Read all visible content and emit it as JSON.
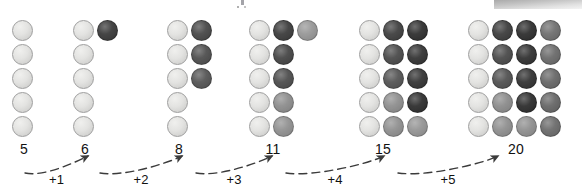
{
  "figure": {
    "type": "dot-array-sequence-diagram",
    "circle": {
      "diameter_px": 21,
      "row_pitch_px": 24,
      "col_pitch_px": 24,
      "rows_per_column": 5
    },
    "palette": {
      "light": "#e4e4e2",
      "outline": "#9e9e9e",
      "dark_1": "#3a3a3a",
      "dark_2": "#4a4a4a",
      "dark_3": "#565656",
      "mid_1": "#8a8a8a",
      "mid_2": "#949494",
      "mid_3": "#7e7e7e",
      "near_black": "#2b2b2b",
      "text": "#111111",
      "arrow": "#3b3b3b"
    },
    "groups": [
      {
        "total_label": "5",
        "total_value": 5,
        "x": 12,
        "label_x": -8,
        "columns": [
          {
            "count": 5,
            "shades": [
              "light",
              "light",
              "light",
              "light",
              "light"
            ]
          }
        ]
      },
      {
        "total_label": "6",
        "total_value": 6,
        "x": 73,
        "label_x": -8,
        "columns": [
          {
            "count": 5,
            "shades": [
              "light",
              "light",
              "light",
              "light",
              "light"
            ]
          },
          {
            "count": 1,
            "shades": [
              "#3a3a3a"
            ]
          }
        ]
      },
      {
        "total_label": "8",
        "total_value": 8,
        "x": 167,
        "label_x": -8,
        "columns": [
          {
            "count": 5,
            "shades": [
              "light",
              "light",
              "light",
              "light",
              "light"
            ]
          },
          {
            "count": 3,
            "shades": [
              "#474747",
              "#4e4e4e",
              "#545454"
            ]
          }
        ]
      },
      {
        "total_label": "11",
        "total_value": 11,
        "x": 249,
        "label_x": 4,
        "columns": [
          {
            "count": 5,
            "shades": [
              "light",
              "light",
              "light",
              "light",
              "light"
            ]
          },
          {
            "count": 5,
            "shades": [
              "#3c3c3c",
              "#454545",
              "#4d4d4d",
              "#8c8c8c",
              "#909090"
            ]
          },
          {
            "count": 1,
            "shades": [
              "#969696"
            ]
          }
        ]
      },
      {
        "total_label": "15",
        "total_value": 15,
        "x": 359,
        "label_x": 4,
        "columns": [
          {
            "count": 5,
            "shades": [
              "light",
              "light",
              "light",
              "light",
              "light"
            ]
          },
          {
            "count": 5,
            "shades": [
              "#3f3f3f",
              "#4a4a4a",
              "#545454",
              "#8d8d8d",
              "#8f8f8f"
            ]
          },
          {
            "count": 5,
            "shades": [
              "#2f2f2f",
              "#333333",
              "#343434",
              "#2e2e2e",
              "#949494"
            ]
          }
        ]
      },
      {
        "total_label": "20",
        "total_value": 20,
        "x": 468,
        "label_x": 28,
        "columns": [
          {
            "count": 5,
            "shades": [
              "light",
              "light",
              "light",
              "light",
              "light"
            ]
          },
          {
            "count": 5,
            "shades": [
              "#3d3d3d",
              "#4a4a4a",
              "#515151",
              "#8b8b8b",
              "#8e8e8e"
            ]
          },
          {
            "count": 5,
            "shades": [
              "#2e2e2e",
              "#313131",
              "#333333",
              "#2d2d2d",
              "#8f8f8f"
            ]
          },
          {
            "count": 5,
            "shades": [
              "#6e6e6e",
              "#6a6a6a",
              "#676767",
              "#666666",
              "#6b6b6b"
            ]
          }
        ]
      }
    ],
    "steps": [
      {
        "label": "+1",
        "x": 141,
        "from_x": 25,
        "to_x": 88,
        "peak_y": 158
      },
      {
        "label": "+2",
        "x": 240,
        "from_x": 100,
        "to_x": 182,
        "peak_y": 158
      },
      {
        "label": "+3",
        "x": 348,
        "from_x": 196,
        "to_x": 272,
        "peak_y": 158
      },
      {
        "label": "+4",
        "x": 452,
        "from_x": 286,
        "to_x": 384,
        "peak_y": 158
      },
      {
        "label": "+5",
        "x": 556,
        "from_x": 398,
        "to_x": 498,
        "peak_y": 158
      }
    ]
  }
}
